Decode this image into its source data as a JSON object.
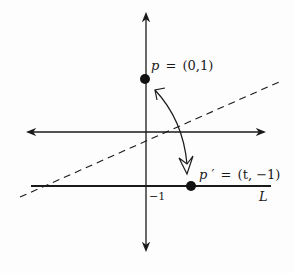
{
  "diagram": {
    "points": {
      "p": {
        "name": "p",
        "label_lhs": "p",
        "label_rhs": "(0,1)",
        "coords": [
          0,
          1
        ]
      },
      "p_prime": {
        "name": "p′",
        "label_lhs": "p",
        "prime": "′",
        "label_rhs": "(t, −1)",
        "coords": [
          "t",
          -1
        ]
      }
    },
    "labels": {
      "equals": "=",
      "tick_minus_one": "−1",
      "line_L": "L"
    },
    "elements": {
      "axes": [
        "vertical-axis",
        "horizontal-axis"
      ],
      "line_L": "horizontal line y = -1",
      "dashed_line": "perpendicular bisector (mirror line)",
      "curved_arrow": "maps p to p′"
    },
    "colors": {
      "ink": "#1a1a1a",
      "background": "#fdfdfd"
    }
  }
}
